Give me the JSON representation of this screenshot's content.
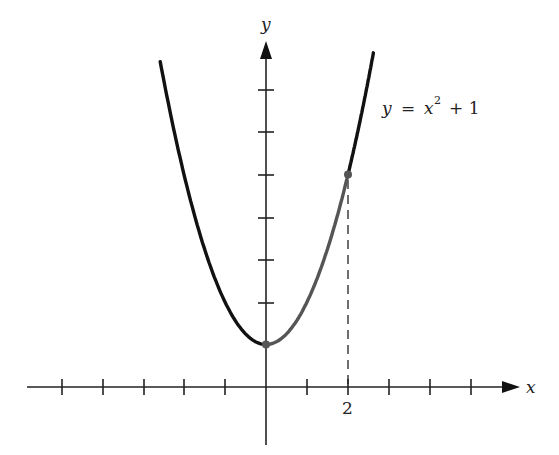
{
  "figure": {
    "x_axis_label": "x",
    "y_axis_label": "y",
    "equation": {
      "lhs": "y",
      "eq": "=",
      "base": "x",
      "exp": "2",
      "rest": "+ 1"
    },
    "x_tick_label": "2",
    "highlight_point": {
      "x": 2,
      "y": 5
    },
    "vertex_point": {
      "x": 0,
      "y": 1
    },
    "colors": {
      "curve": "#111111",
      "highlight": "#555555",
      "axis": "#222222"
    }
  },
  "chart_data": {
    "type": "line",
    "xlabel": "x",
    "ylabel": "y",
    "function": "x^2 + 1",
    "x_ticks": [
      -5,
      -4,
      -3,
      -2,
      -1,
      1,
      2,
      3,
      4,
      5
    ],
    "y_ticks": [
      2,
      3,
      4,
      5,
      6,
      7
    ],
    "labeled_x_ticks": [
      "2"
    ],
    "highlighted_segment": {
      "x_from": 0,
      "x_to": 2
    },
    "marked_points": [
      {
        "x": 0,
        "y": 1
      },
      {
        "x": 2,
        "y": 5
      }
    ],
    "dashed_drop_line": {
      "x": 2,
      "y_from": 0,
      "y_to": 5
    },
    "xlim": [
      -5.9,
      6.2
    ],
    "ylim": [
      -1.2,
      8.5
    ],
    "grid": false
  }
}
